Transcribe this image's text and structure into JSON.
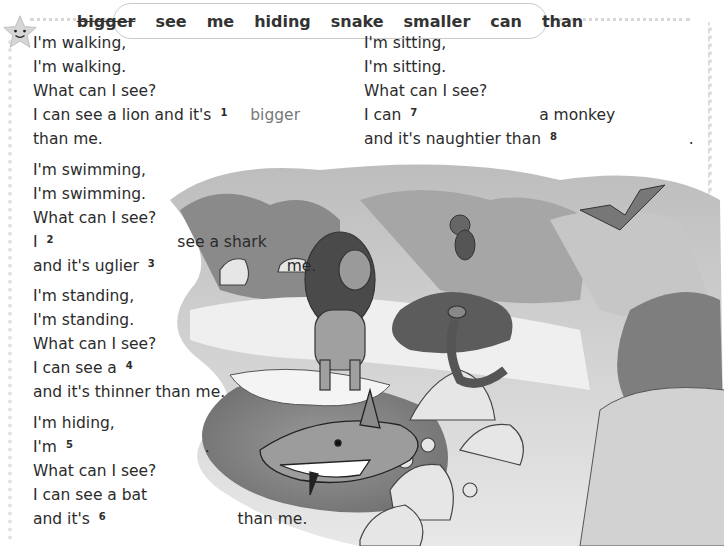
{
  "word_bank": {
    "words": [
      {
        "text": "bigger",
        "used": true
      },
      {
        "text": "see",
        "used": false
      },
      {
        "text": "me",
        "used": false
      },
      {
        "text": "hiding",
        "used": false
      },
      {
        "text": "snake",
        "used": false
      },
      {
        "text": "smaller",
        "used": false
      },
      {
        "text": "can",
        "used": false
      },
      {
        "text": "than",
        "used": false
      }
    ]
  },
  "stanzas": {
    "walking": {
      "l1": "I'm walking,",
      "l2": "I'm walking.",
      "l3": "What can I see?",
      "l4_pre": "I can see a lion and it's",
      "l4_num": "1",
      "l4_answer": "bigger",
      "l5": "than me."
    },
    "swimming": {
      "l1": "I'm swimming,",
      "l2": "I'm swimming.",
      "l3": "What can I see?",
      "l4_pre": "I",
      "l4_num": "2",
      "l4_post": "see a shark",
      "l5_pre": "and it's uglier",
      "l5_num": "3",
      "l5_post": "me."
    },
    "standing": {
      "l1": "I'm standing,",
      "l2": "I'm standing.",
      "l3": "What can I see?",
      "l4_pre": "I can see a",
      "l4_num": "4",
      "l5": "and it's thinner than me."
    },
    "hiding": {
      "l1": "I'm hiding,",
      "l2_pre": "I'm",
      "l2_num": "5",
      "l2_post": ".",
      "l3": "What can I see?",
      "l4": "I can see a bat",
      "l5_pre": "and it's",
      "l5_num": "6",
      "l5_post": "than me."
    },
    "sitting": {
      "l1": "I'm sitting,",
      "l2": "I'm sitting.",
      "l3": "What can I see?",
      "l4_pre": "I can",
      "l4_num": "7",
      "l4_post": "a monkey",
      "l5_pre": "and it's naughtier than",
      "l5_num": "8",
      "l5_post": "."
    }
  },
  "illustration": {
    "subjects": [
      "lion",
      "monkey",
      "bat",
      "snake",
      "shark",
      "rocks",
      "jungle"
    ]
  },
  "colors": {
    "text": "#2b2b2b",
    "answer": "#777777",
    "border": "#c9c9c9"
  }
}
